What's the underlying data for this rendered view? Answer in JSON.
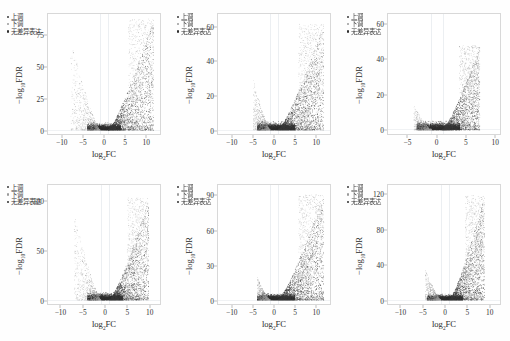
{
  "figure": {
    "layout": "2 rows x 3 columns",
    "legend": {
      "up_label": "上调",
      "down_label": "下调",
      "none_label": "无差异表达",
      "up_color": "#3a3a3a",
      "down_color": "#9a9a9a",
      "none_color": "#2e2e2e"
    },
    "axis": {
      "xlabel_base": "log",
      "xlabel_sub": "2",
      "xlabel_tail": "FC",
      "ylabel_base": "−log",
      "ylabel_sub": "10",
      "ylabel_tail": "FDR"
    }
  },
  "chart_data": [
    {
      "type": "scatter",
      "title": "T1 vs T0",
      "xlabel": "log2FC",
      "ylabel": "-log10FDR",
      "xlim": [
        -13.5,
        13.5
      ],
      "ylim": [
        -3,
        92
      ],
      "xticks": [
        -10,
        -5,
        0,
        5,
        10
      ],
      "yticks": [
        0,
        25,
        50,
        75
      ],
      "grid": false,
      "legend_position": "top-left",
      "thresholds": {
        "x": [
          -1,
          1
        ]
      },
      "series": [
        {
          "name": "上调",
          "n_points": 2600,
          "x_range": [
            1,
            12
          ],
          "y_range": [
            2,
            88
          ]
        },
        {
          "name": "下调",
          "n_points": 900,
          "x_range": [
            -8,
            -1
          ],
          "y_range": [
            2,
            72
          ]
        },
        {
          "name": "无差异表达",
          "n_points": 4200,
          "x_range": [
            -4,
            4
          ],
          "y_range": [
            0,
            6
          ]
        }
      ]
    },
    {
      "type": "scatter",
      "title": "T2 vs T0",
      "xlabel": "log2FC",
      "ylabel": "-log10FDR",
      "xlim": [
        -13.5,
        13.5
      ],
      "ylim": [
        -2.3,
        68
      ],
      "xticks": [
        -10,
        -5,
        0,
        5,
        10
      ],
      "yticks": [
        0,
        20,
        40,
        60
      ],
      "grid": false,
      "legend_position": "top-left",
      "thresholds": {
        "x": [
          -1,
          1
        ]
      },
      "series": [
        {
          "name": "上调",
          "n_points": 2800,
          "x_range": [
            1,
            12
          ],
          "y_range": [
            2,
            62
          ]
        },
        {
          "name": "下调",
          "n_points": 850,
          "x_range": [
            -5,
            -1
          ],
          "y_range": [
            2,
            30
          ]
        },
        {
          "name": "无差异表达",
          "n_points": 4400,
          "x_range": [
            -4,
            5
          ],
          "y_range": [
            0,
            5
          ]
        }
      ]
    },
    {
      "type": "scatter",
      "title": "T1 vs T2",
      "xlabel": "log2FC",
      "ylabel": "-log10FDR",
      "xlim": [
        -8.5,
        11
      ],
      "ylim": [
        -2.3,
        66
      ],
      "xticks": [
        -5,
        0,
        5,
        10
      ],
      "yticks": [
        0,
        20,
        40,
        60
      ],
      "grid": false,
      "legend_position": "top-left",
      "thresholds": {
        "x": [
          -1,
          1
        ]
      },
      "series": [
        {
          "name": "上调",
          "n_points": 2500,
          "x_range": [
            1,
            7.5
          ],
          "y_range": [
            2,
            48
          ]
        },
        {
          "name": "下调",
          "n_points": 700,
          "x_range": [
            -4,
            -1
          ],
          "y_range": [
            2,
            14
          ]
        },
        {
          "name": "无差异表达",
          "n_points": 4300,
          "x_range": [
            -3.5,
            4
          ],
          "y_range": [
            0,
            5
          ]
        }
      ]
    },
    {
      "type": "scatter",
      "title": "S1 vs S0",
      "xlabel": "log2FC",
      "ylabel": "-log10FDR",
      "xlim": [
        -13,
        12.5
      ],
      "ylim": [
        -4,
        118
      ],
      "xticks": [
        -10,
        -5,
        0,
        5,
        10
      ],
      "yticks": [
        0,
        50,
        100
      ],
      "grid": false,
      "legend_position": "top-left",
      "thresholds": {
        "x": [
          -1,
          1
        ]
      },
      "series": [
        {
          "name": "上调",
          "n_points": 2700,
          "x_range": [
            1,
            10
          ],
          "y_range": [
            2,
            105
          ]
        },
        {
          "name": "下调",
          "n_points": 950,
          "x_range": [
            -7,
            -1
          ],
          "y_range": [
            2,
            88
          ]
        },
        {
          "name": "无差异表达",
          "n_points": 4300,
          "x_range": [
            -4,
            4
          ],
          "y_range": [
            0,
            8
          ]
        }
      ]
    },
    {
      "type": "scatter",
      "title": "S2 vs S0",
      "xlabel": "log2FC",
      "ylabel": "-log10FDR",
      "xlim": [
        -13.5,
        13.5
      ],
      "ylim": [
        -3.4,
        100
      ],
      "xticks": [
        -10,
        -5,
        0,
        5,
        10
      ],
      "yticks": [
        0,
        30,
        60,
        90
      ],
      "grid": false,
      "legend_position": "top-left",
      "thresholds": {
        "x": [
          -1,
          1
        ]
      },
      "series": [
        {
          "name": "上调",
          "n_points": 2800,
          "x_range": [
            1,
            12
          ],
          "y_range": [
            2,
            92
          ]
        },
        {
          "name": "下调",
          "n_points": 800,
          "x_range": [
            -4,
            -1
          ],
          "y_range": [
            2,
            20
          ]
        },
        {
          "name": "无差异表达",
          "n_points": 4400,
          "x_range": [
            -4,
            5
          ],
          "y_range": [
            0,
            6
          ]
        }
      ]
    },
    {
      "type": "scatter",
      "title": "S1 vs S2",
      "xlabel": "log2FC",
      "ylabel": "-log10FDR",
      "xlim": [
        -13,
        12.5
      ],
      "ylim": [
        -4.5,
        132
      ],
      "xticks": [
        -10,
        -5,
        0,
        5,
        10
      ],
      "yticks": [
        0,
        40,
        80,
        120
      ],
      "grid": false,
      "legend_position": "top-left",
      "thresholds": {
        "x": [
          -1,
          1
        ]
      },
      "series": [
        {
          "name": "上调",
          "n_points": 2600,
          "x_range": [
            1,
            9
          ],
          "y_range": [
            2,
            120
          ]
        },
        {
          "name": "下调",
          "n_points": 850,
          "x_range": [
            -4.5,
            -1
          ],
          "y_range": [
            2,
            35
          ]
        },
        {
          "name": "无差异表达",
          "n_points": 4300,
          "x_range": [
            -4,
            4
          ],
          "y_range": [
            0,
            7
          ]
        }
      ]
    }
  ]
}
